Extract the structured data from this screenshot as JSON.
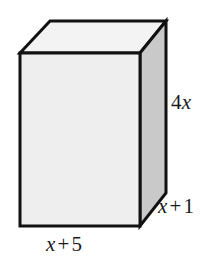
{
  "figure": {
    "kind": "rectangular-prism-diagram",
    "canvas": {
      "width": 221,
      "height": 264
    },
    "background_color": "#ffffff",
    "stroke_color": "#111111",
    "stroke_width": 3,
    "faces": {
      "front": {
        "name": "front-face",
        "fill": "#eeeeee",
        "points": "20,53 140,53 140,226 20,226"
      },
      "top": {
        "name": "top-face",
        "fill": "#f3f3f3",
        "points": "20,53 50,21 166,21 140,53"
      },
      "right": {
        "name": "right-face",
        "fill": "#c9c9c9",
        "points": "140,53 166,21 166,193 140,226"
      }
    },
    "labels": {
      "height": {
        "text": "4x",
        "coefficient": "4",
        "variable": "x",
        "edge": "vertical-right-edge"
      },
      "depth": {
        "text": "x + 1",
        "variable": "x",
        "operator": "+",
        "constant": "1",
        "edge": "depth-diagonal-edge"
      },
      "width": {
        "text": "x + 5",
        "variable": "x",
        "operator": "+",
        "constant": "5",
        "edge": "bottom-front-edge"
      }
    }
  }
}
